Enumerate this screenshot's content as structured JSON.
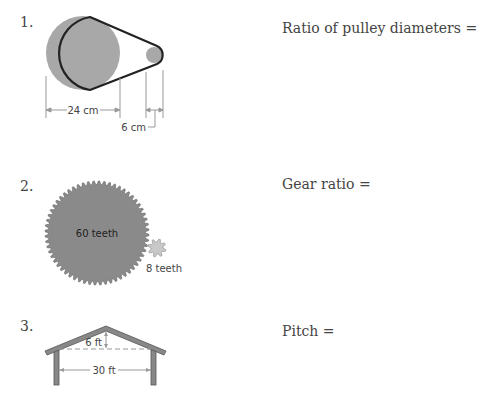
{
  "problems": [
    {
      "number": "1.",
      "prompt": "Ratio of pulley diameters =",
      "figure": {
        "type": "pulley",
        "large_diameter_label": "24 cm",
        "small_diameter_label": "6 cm"
      }
    },
    {
      "number": "2.",
      "prompt": "Gear ratio =",
      "figure": {
        "type": "gears",
        "large_gear_label": "60 teeth",
        "small_gear_label": "8 teeth"
      }
    },
    {
      "number": "3.",
      "prompt": "Pitch =",
      "figure": {
        "type": "roof",
        "rise_label": "6 ft",
        "span_label": "30 ft"
      }
    }
  ],
  "colors": {
    "fill_gray": "#a8a8a8",
    "gear_gray": "#8a8a8a",
    "small_gear_gray": "#c8c8c8",
    "outline": "#222222",
    "dim_line": "#999999"
  }
}
